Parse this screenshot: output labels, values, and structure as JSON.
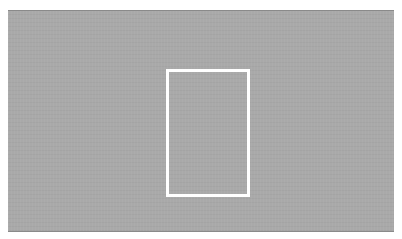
{
  "image": {
    "description": "Gray textured rectangle with a white outlined rectangle in the center",
    "colors": {
      "background": "#ffffff",
      "canvas": "#a9a9a9",
      "frame": "#ffffff"
    }
  }
}
